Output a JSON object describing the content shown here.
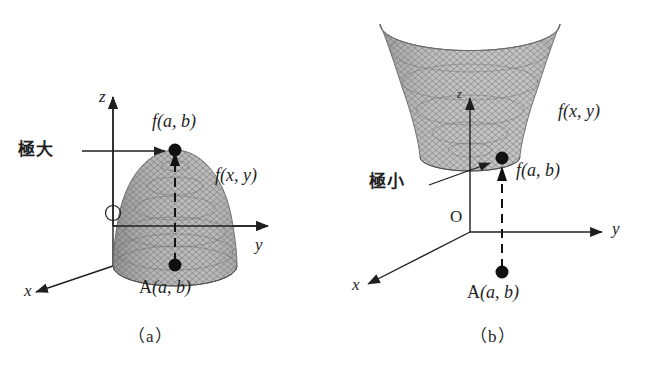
{
  "figure": {
    "background_color": "#ffffff",
    "ink_color": "#1f1f1f",
    "surface_fill_dark": "#8d8d8d",
    "surface_fill_light": "#cfcfcf",
    "mesh_color": "#6b6b6b"
  },
  "panels": [
    {
      "id": "a",
      "caption": "（a）",
      "surface_type": "downward-paraboloid-dome",
      "annotation_label": "極大",
      "annotation_meaning": "local maximum",
      "point_value_label": "f(a, b)",
      "surface_label": "f(x, y)",
      "base_point_label": "A(a, b)",
      "origin_label": "O",
      "axes": {
        "x": "x",
        "y": "y",
        "z": "z"
      }
    },
    {
      "id": "b",
      "caption": "（b）",
      "surface_type": "upward-paraboloid-bowl",
      "annotation_label": "極小",
      "annotation_meaning": "local minimum",
      "point_value_label": "f(a, b)",
      "surface_label": "f(x, y)",
      "base_point_label": "A(a, b)",
      "origin_label": "O",
      "axes": {
        "x": "x",
        "y": "y",
        "z": "z"
      }
    }
  ]
}
